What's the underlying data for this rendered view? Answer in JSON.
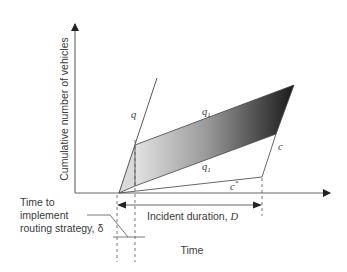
{
  "diagram": {
    "type": "cumulative-vehicle-queueing-diagram",
    "axes": {
      "y_label": "Cumulative number of vehicles",
      "x_label": "Time"
    },
    "curves": {
      "arrival_rate": "q",
      "diverted_arrival_upper": "q",
      "diverted_arrival_upper_sub": "1",
      "diverted_arrival_lower": "q",
      "diverted_arrival_lower_sub": "1",
      "capacity": "c",
      "reduced_capacity": "c",
      "reduced_capacity_sup": "*"
    },
    "annotations": {
      "incident_duration": "Incident duration, ",
      "incident_duration_symbol": "D",
      "routing_delay_line1": "Time to",
      "routing_delay_line2": "implement",
      "routing_delay_line3": "routing strategy, δ"
    },
    "colors": {
      "line": "#555555",
      "shade_light": "#e4e4e4",
      "shade_dark": "#1c1c1c",
      "wedge": "#d8d8d8"
    }
  }
}
